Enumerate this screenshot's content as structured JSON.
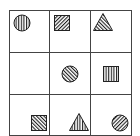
{
  "puzzle": {
    "type": "3x3 figure matrix",
    "rows": 3,
    "cols": 3,
    "cells": [
      {
        "row": 0,
        "col": 0,
        "shape": "circle",
        "pattern": "vertical-lines",
        "position": "top-left"
      },
      {
        "row": 0,
        "col": 1,
        "shape": "square",
        "pattern": "diagonal-lines-forward",
        "position": "top-left"
      },
      {
        "row": 0,
        "col": 2,
        "shape": "triangle",
        "pattern": "diagonal-lines-backward",
        "position": "top-left"
      },
      {
        "row": 1,
        "col": 0,
        "shape": "empty",
        "pattern": "none",
        "position": "none"
      },
      {
        "row": 1,
        "col": 1,
        "shape": "circle",
        "pattern": "diagonal-lines-backward",
        "position": "center"
      },
      {
        "row": 1,
        "col": 2,
        "shape": "square",
        "pattern": "vertical-lines",
        "position": "center"
      },
      {
        "row": 2,
        "col": 0,
        "shape": "square",
        "pattern": "diagonal-lines-backward",
        "position": "bottom-right"
      },
      {
        "row": 2,
        "col": 1,
        "shape": "triangle",
        "pattern": "vertical-lines",
        "position": "bottom-right"
      },
      {
        "row": 2,
        "col": 2,
        "shape": "circle",
        "pattern": "diagonal-lines-forward",
        "position": "bottom-right"
      }
    ]
  },
  "colors": {
    "line": "#444444",
    "fill": "#222222",
    "background": "#ffffff"
  }
}
